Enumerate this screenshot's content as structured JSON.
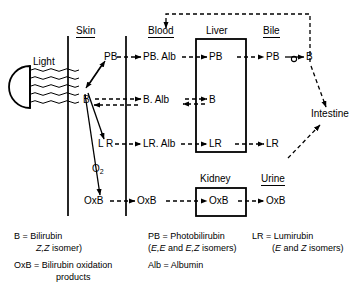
{
  "diagram": {
    "compartments": [
      {
        "id": "skin",
        "label": "Skin"
      },
      {
        "id": "blood",
        "label": "Blood"
      },
      {
        "id": "liver",
        "label": "Liver"
      },
      {
        "id": "bile",
        "label": "Bile"
      },
      {
        "id": "kidney",
        "label": "Kidney"
      },
      {
        "id": "urine",
        "label": "Urine"
      }
    ],
    "light_source": {
      "label": "Light"
    },
    "nodes": {
      "skin_pb": "PB",
      "skin_b": "B",
      "skin_lr": "L R",
      "skin_oxb": "OxB",
      "oxygen": "O",
      "oxygen_sub": "2",
      "blood_pb_alb": "PB. Alb",
      "blood_b_alb": "B. Alb",
      "blood_lr_alb": "LR. Alb",
      "blood_oxb": "OxB",
      "liver_pb": "PB",
      "liver_b": "B",
      "liver_lr": "LR",
      "bile_pb": "PB",
      "bile_b": "B",
      "bile_lr": "LR",
      "kidney_oxb": "OxB",
      "urine_oxb": "OxB",
      "intestine": "Intestine"
    },
    "legend": {
      "b_term": "B = Bilirubin",
      "b_detail": "(Z,Z isomer)",
      "b_detail_italic": "Z,Z",
      "oxb_term": "OxB = Bilirubin oxidation",
      "oxb_detail": "products",
      "pb_term": "PB = Photobilirubin",
      "pb_detail": "(E,E and E,Z isomers)",
      "alb_term": "Alb = Albumin",
      "lr_term": "LR = Lumirubin",
      "lr_detail": "(E and Z isomers)"
    },
    "colors": {
      "ink": "#000000",
      "background": "#ffffff"
    }
  }
}
